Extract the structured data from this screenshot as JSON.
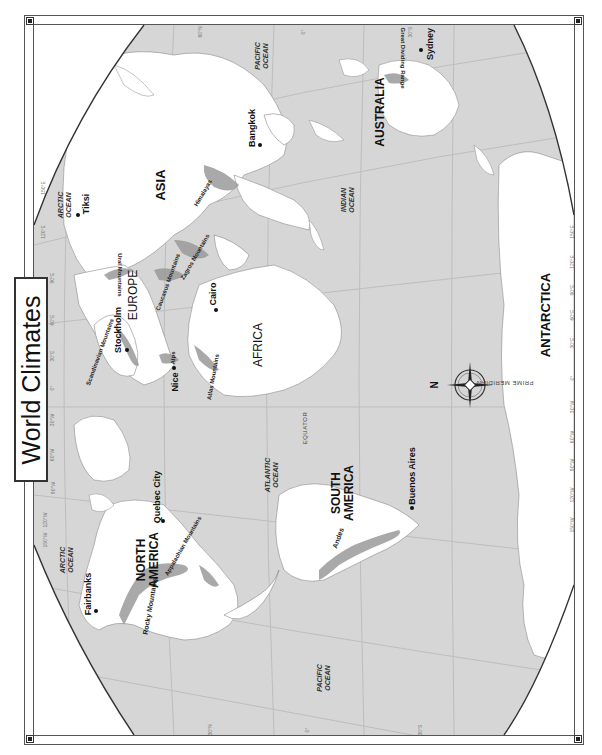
{
  "title": "World Climates",
  "map": {
    "orientation": "rotated 90° counterclockwise (north points left)",
    "colors": {
      "ocean": "#d6d6d6",
      "land": "#ffffff",
      "mountains": "#9a9a9a",
      "grid": "#bdbdbd",
      "frame": "#555555",
      "text": "#111111"
    },
    "continents": [
      {
        "label": "NORTH AMERICA"
      },
      {
        "label": "SOUTH AMERICA"
      },
      {
        "label": "EUROPE"
      },
      {
        "label": "AFRICA"
      },
      {
        "label": "ASIA"
      },
      {
        "label": "AUSTRALIA"
      },
      {
        "label": "ANTARCTICA"
      }
    ],
    "oceans": [
      {
        "label_line1": "ARCTIC",
        "label_line2": "OCEAN",
        "id": "arctic-asia"
      },
      {
        "label_line1": "ARCTIC",
        "label_line2": "OCEAN",
        "id": "arctic-america"
      },
      {
        "label_line1": "PACIFIC",
        "label_line2": "OCEAN",
        "id": "pacific-east"
      },
      {
        "label_line1": "PACIFIC",
        "label_line2": "OCEAN",
        "id": "pacific-west"
      },
      {
        "label_line1": "ATLANTIC",
        "label_line2": "OCEAN",
        "id": "atlantic"
      },
      {
        "label_line1": "INDIAN",
        "label_line2": "OCEAN",
        "id": "indian"
      }
    ],
    "cities": [
      {
        "name": "Fairbanks"
      },
      {
        "name": "Quebec City"
      },
      {
        "name": "Buenos Aires"
      },
      {
        "name": "Stockholm"
      },
      {
        "name": "Nice"
      },
      {
        "name": "Cairo"
      },
      {
        "name": "Tiksi"
      },
      {
        "name": "Bangkok"
      },
      {
        "name": "Sydney"
      }
    ],
    "mountains": [
      {
        "name": "Rocky Mountains"
      },
      {
        "name": "Appalachian Mountains"
      },
      {
        "name": "Andes"
      },
      {
        "name": "Scandinavian Mountains"
      },
      {
        "name": "Alps"
      },
      {
        "name": "Atlas Mountains"
      },
      {
        "name": "Ural Mountains"
      },
      {
        "name": "Caucasus Mountains"
      },
      {
        "name": "Zagros Mountains"
      },
      {
        "name": "Himalayas"
      },
      {
        "name": "Great Dividing Range"
      }
    ],
    "reference_lines": [
      {
        "label": "EQUATOR"
      },
      {
        "label": "PRIME MERIDIAN"
      }
    ],
    "compass": {
      "label": "N"
    },
    "longitude_labels": [
      "150°E",
      "120°E",
      "90°E",
      "60°E",
      "30°E",
      "0°",
      "30°W",
      "60°W",
      "90°W",
      "120°W",
      "150°W"
    ],
    "latitude_labels": [
      "60°N",
      "30°N",
      "0°",
      "30°S",
      "60°S"
    ]
  }
}
